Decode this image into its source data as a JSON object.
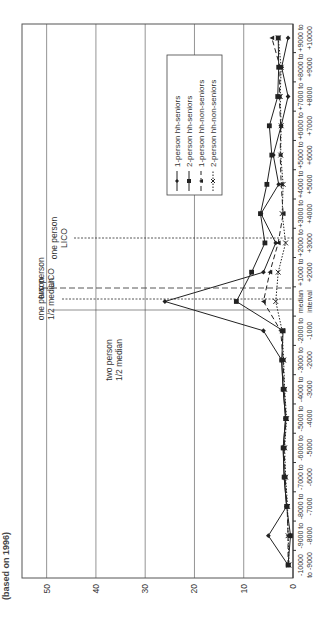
{
  "title_fragment": "(based on 1996)",
  "chart_data": {
    "type": "line",
    "orientation": "rotated-90-ccw",
    "title": "",
    "xlabel": "",
    "ylabel": "",
    "ylim": [
      0,
      55
    ],
    "yticks": [
      0,
      10,
      20,
      30,
      40,
      50
    ],
    "grid": true,
    "legend_position": "upper-right (inside plot)",
    "categories": [
      "-10000 to -9000",
      "-9000 to -8000",
      "-8000 to -7000",
      "-7000 to -6000",
      "-6000 to -5000",
      "-5000 to -4000",
      "-4000 to -3000",
      "-3000 to -2000",
      "-2000 to -1000",
      "median interval",
      "+1000 to +2000",
      "+2000 to +3000",
      "+3000 to +4000",
      "+4000 to +5000",
      "+5000 to +6000",
      "+6000 to +7000",
      "+7000 to +8000",
      "+8000 to +9000",
      "+9000 to +10000"
    ],
    "category_labels": [
      [
        "-10000",
        "to -9000"
      ],
      [
        "-9000 to",
        "-8000"
      ],
      [
        "-8000 to",
        "-7000"
      ],
      [
        "-7000 to",
        "-6000"
      ],
      [
        "-6000 to",
        "-5000"
      ],
      [
        "-5000 to",
        "-4000"
      ],
      [
        "-4000 to",
        "-3000"
      ],
      [
        "-3000 to",
        "-2000"
      ],
      [
        "-2000 to",
        "-1000"
      ],
      [
        "median",
        "interval"
      ],
      [
        "+1000 to",
        "+2000"
      ],
      [
        "+2000 to",
        "+3000"
      ],
      [
        "+3000 to",
        "+4000"
      ],
      [
        "+4000 to",
        "+5000"
      ],
      [
        "+5000 to",
        "+6000"
      ],
      [
        "+6000 to",
        "+7000"
      ],
      [
        "+7000 to",
        "+8000"
      ],
      [
        "+8000 to",
        "+9000"
      ],
      [
        "+9000 to",
        "+10000"
      ]
    ],
    "series": [
      {
        "name": "1-person hh-seniors",
        "marker": "diamond",
        "line": "solid",
        "values": [
          1,
          5,
          1.3,
          1.8,
          2,
          1.5,
          2,
          2.3,
          6,
          26,
          6,
          3.5,
          6.5,
          2.9,
          4,
          2.4,
          1,
          2.3,
          1
        ]
      },
      {
        "name": "2-person hh-seniors",
        "marker": "square",
        "line": "solid",
        "values": [
          1,
          0.5,
          1.3,
          1.8,
          2,
          1.5,
          2,
          2.3,
          2,
          11.5,
          8.4,
          5.7,
          6.6,
          5.3,
          4.3,
          4.8,
          3.1,
          2.9,
          3
        ]
      },
      {
        "name": "1-person hh-non-seniors",
        "marker": "triangle",
        "line": "dashed",
        "values": [
          1,
          1,
          1.2,
          1.6,
          1.8,
          1.4,
          1.8,
          2,
          2.5,
          6,
          4.7,
          3,
          2,
          2.4,
          2.6,
          2.5,
          2.8,
          2.6,
          4.3
        ]
      },
      {
        "name": "2-person hh-non-seniors",
        "marker": "x",
        "line": "dotted",
        "values": [
          0.8,
          1,
          1.1,
          1.5,
          1.7,
          1.3,
          1.7,
          1.9,
          2.2,
          3.5,
          3,
          1.5,
          2.2,
          2,
          2.5,
          2.4,
          2.6,
          2.4,
          3
        ]
      }
    ],
    "reference_lines": [
      {
        "label": [
          "two person",
          "1/2 median"
        ],
        "position_between": "-1000 and median",
        "style": "solid-thin"
      },
      {
        "label": [
          "one person",
          "1/2 median"
        ],
        "position_between": "-1000 and median",
        "style": "dotted"
      },
      {
        "label": [
          "two person",
          "LICO"
        ],
        "position_between": "median and +1000",
        "style": "dashed"
      },
      {
        "label": [
          "one person",
          "LICO"
        ],
        "position_between": "+2000 and +3000",
        "style": "dotted"
      }
    ]
  },
  "legend": [
    {
      "label": "1-person hh-seniors",
      "marker": "diamond",
      "line": "solid"
    },
    {
      "label": "2-person hh-seniors",
      "marker": "square",
      "line": "solid"
    },
    {
      "label": "1-person hh-non-seniors",
      "marker": "triangle",
      "line": "dashed"
    },
    {
      "label": "2-person hh-non-seniors",
      "marker": "x",
      "line": "dotted"
    }
  ],
  "colors": {
    "line": "#222222",
    "grid": "#7a7a7a",
    "background": "#ffffff"
  }
}
